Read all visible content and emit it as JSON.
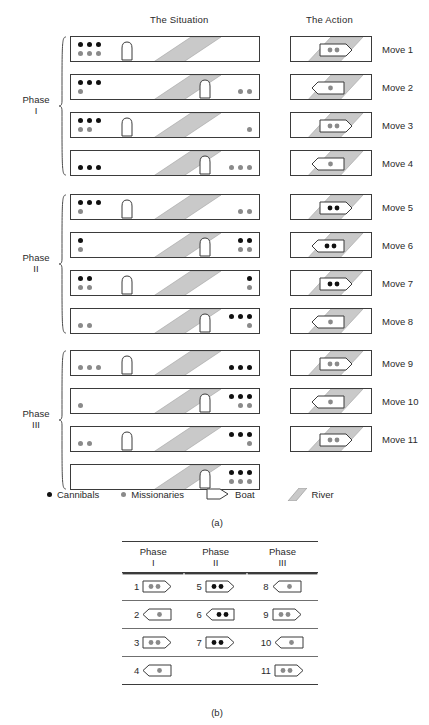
{
  "headers": {
    "situation": "The Situation",
    "action": "The Action"
  },
  "colors": {
    "cannibal_dot": "#111111",
    "missionary_dot": "#8a8a8a",
    "river_fill": "#c9c9c9",
    "outline": "#3b3b3b",
    "bank": "#ffffff"
  },
  "phases": [
    {
      "name_line1": "Phase",
      "name_line2": "I"
    },
    {
      "name_line1": "Phase",
      "name_line2": "II"
    },
    {
      "name_line1": "Phase",
      "name_line2": "III"
    }
  ],
  "moves": [
    {
      "label": "Move 1",
      "phase": 0,
      "left_bank": [
        [
          "c",
          "c",
          "c"
        ],
        [
          "m",
          "m",
          "m"
        ]
      ],
      "right_bank": [],
      "boat_side": "left",
      "action": {
        "direction": "right",
        "passengers": [
          "m",
          "m"
        ]
      }
    },
    {
      "label": "Move 2",
      "phase": 0,
      "left_bank": [
        [
          "c",
          "c",
          "c"
        ],
        [
          "m"
        ]
      ],
      "right_bank": [
        [
          "m",
          "m"
        ]
      ],
      "boat_side": "right",
      "action": {
        "direction": "left",
        "passengers": [
          "m"
        ]
      }
    },
    {
      "label": "Move 3",
      "phase": 0,
      "left_bank": [
        [
          "c",
          "c",
          "c"
        ],
        [
          "m",
          "m"
        ]
      ],
      "right_bank": [
        [
          "m"
        ]
      ],
      "boat_side": "left",
      "action": {
        "direction": "right",
        "passengers": [
          "m",
          "m"
        ]
      }
    },
    {
      "label": "Move 4",
      "phase": 0,
      "left_bank": [
        [
          "c",
          "c",
          "c"
        ]
      ],
      "right_bank": [
        [
          "m",
          "m",
          "m"
        ]
      ],
      "boat_side": "right",
      "action": {
        "direction": "left",
        "passengers": [
          "m"
        ]
      }
    },
    {
      "label": "Move 5",
      "phase": 1,
      "left_bank": [
        [
          "c",
          "c",
          "c"
        ],
        [
          "m"
        ]
      ],
      "right_bank": [
        [
          "m",
          "m"
        ]
      ],
      "boat_side": "left",
      "action": {
        "direction": "right",
        "passengers": [
          "c",
          "c"
        ]
      }
    },
    {
      "label": "Move 6",
      "phase": 1,
      "left_bank": [
        [
          "c"
        ],
        [
          "m"
        ]
      ],
      "right_bank": [
        [
          "c",
          "c"
        ],
        [
          "m",
          "m"
        ]
      ],
      "boat_side": "right",
      "action": {
        "direction": "left",
        "passengers": [
          "c",
          "c"
        ]
      }
    },
    {
      "label": "Move 7",
      "phase": 1,
      "left_bank": [
        [
          "c",
          "c"
        ],
        [
          "m",
          "m"
        ]
      ],
      "right_bank": [
        [
          "c"
        ],
        [
          "m"
        ]
      ],
      "boat_side": "left",
      "action": {
        "direction": "right",
        "passengers": [
          "c",
          "c"
        ]
      }
    },
    {
      "label": "Move 8",
      "phase": 1,
      "left_bank": [
        [
          "m",
          "m"
        ]
      ],
      "right_bank": [
        [
          "c",
          "c",
          "c"
        ],
        [
          "m"
        ]
      ],
      "boat_side": "right",
      "action": {
        "direction": "left",
        "passengers": [
          "m"
        ]
      }
    },
    {
      "label": "Move 9",
      "phase": 2,
      "left_bank": [
        [
          "m",
          "m",
          "m"
        ]
      ],
      "right_bank": [
        [
          "c",
          "c",
          "c"
        ]
      ],
      "boat_side": "left",
      "action": {
        "direction": "right",
        "passengers": [
          "m",
          "m"
        ]
      }
    },
    {
      "label": "Move 10",
      "phase": 2,
      "left_bank": [
        [
          "m"
        ]
      ],
      "right_bank": [
        [
          "c",
          "c",
          "c"
        ],
        [
          "m",
          "m"
        ]
      ],
      "boat_side": "right",
      "action": {
        "direction": "left",
        "passengers": [
          "m"
        ]
      }
    },
    {
      "label": "Move 11",
      "phase": 2,
      "left_bank": [
        [
          "m",
          "m"
        ]
      ],
      "right_bank": [
        [
          "c",
          "c",
          "c"
        ],
        [
          "m"
        ]
      ],
      "boat_side": "left",
      "action": {
        "direction": "right",
        "passengers": [
          "m",
          "m"
        ]
      }
    },
    {
      "label": "",
      "phase": 2,
      "left_bank": [],
      "right_bank": [
        [
          "c",
          "c",
          "c"
        ],
        [
          "m",
          "m",
          "m"
        ]
      ],
      "boat_side": "right",
      "action": null
    }
  ],
  "legend": {
    "cannibals": "Cannibals",
    "missionaries": "Missionaries",
    "boat": "Boat",
    "river": "River"
  },
  "subfigures": {
    "a": "(a)",
    "b": "(b)"
  },
  "table": {
    "headers": [
      {
        "line1": "Phase",
        "line2": "I"
      },
      {
        "line1": "Phase",
        "line2": "II"
      },
      {
        "line1": "Phase",
        "line2": "III"
      }
    ],
    "rows": [
      [
        {
          "num": "1",
          "direction": "right",
          "passengers": [
            "m",
            "m"
          ]
        },
        {
          "num": "5",
          "direction": "right",
          "passengers": [
            "c",
            "c"
          ]
        },
        {
          "num": "8",
          "direction": "left",
          "passengers": [
            "m"
          ]
        }
      ],
      [
        {
          "num": "2",
          "direction": "left",
          "passengers": [
            "m"
          ]
        },
        {
          "num": "6",
          "direction": "left",
          "passengers": [
            "c",
            "c"
          ]
        },
        {
          "num": "9",
          "direction": "right",
          "passengers": [
            "m",
            "m"
          ]
        }
      ],
      [
        {
          "num": "3",
          "direction": "right",
          "passengers": [
            "m",
            "m"
          ]
        },
        {
          "num": "7",
          "direction": "right",
          "passengers": [
            "c",
            "c"
          ]
        },
        {
          "num": "10",
          "direction": "left",
          "passengers": [
            "m"
          ]
        }
      ],
      [
        {
          "num": "4",
          "direction": "left",
          "passengers": [
            "m"
          ]
        },
        null,
        {
          "num": "11",
          "direction": "right",
          "passengers": [
            "m",
            "m"
          ]
        }
      ]
    ]
  }
}
